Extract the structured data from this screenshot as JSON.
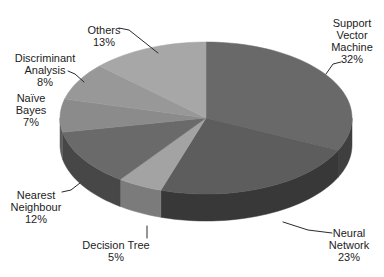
{
  "figure": {
    "background": "#ffffff"
  },
  "chart_data": {
    "type": "pie",
    "style": "3d",
    "unit": "%",
    "legend_position": "none",
    "geometry": {
      "cx": 206,
      "cy": 118,
      "rx": 146,
      "ry": 76,
      "depth": 27,
      "start_angle_deg": 0,
      "direction": "clockwise"
    },
    "label_font_px": 11,
    "label_line_height_px": 12,
    "label_color": "#1c1c1c",
    "leader_color": "#2a2a2a",
    "slices": [
      {
        "label": "Support Vector Machine",
        "value": 32,
        "color_top": "#696969",
        "color_side": "#3f3f3f",
        "label_lines": [
          "Support",
          "Vector",
          "Machine",
          "32%"
        ],
        "label_x": 352,
        "label_y": 27,
        "leader": [
          [
            341,
            62
          ],
          [
            333,
            64
          ],
          [
            326,
            74
          ]
        ]
      },
      {
        "label": "Neural Network",
        "value": 23,
        "color_top": "#5d5d5d",
        "color_side": "#383838",
        "label_lines": [
          "Neural",
          "Network",
          "23%"
        ],
        "label_x": 349,
        "label_y": 237,
        "leader": [
          [
            332,
            233
          ],
          [
            308,
            230
          ],
          [
            283,
            222
          ]
        ]
      },
      {
        "label": "Decision Tree",
        "value": 5,
        "color_top": "#a3a3a3",
        "color_side": "#7b7b7b",
        "label_lines": [
          "Decision Tree",
          "5%"
        ],
        "label_x": 116,
        "label_y": 249,
        "leader": [
          [
            147,
            238
          ],
          [
            147,
            226
          ]
        ]
      },
      {
        "label": "Nearest Neighbour",
        "value": 12,
        "color_top": "#6a6a6a",
        "color_side": "#474747",
        "label_lines": [
          "Nearest",
          "Neighbour",
          "12%"
        ],
        "label_x": 36,
        "label_y": 199,
        "leader": [
          [
            62,
            192
          ],
          [
            71,
            190
          ],
          [
            80,
            183
          ]
        ]
      },
      {
        "label": "Naïve Bayes",
        "value": 7,
        "color_top": "#8b8b8b",
        "color_side": "#5c5c5c",
        "label_lines": [
          "Naïve",
          "Bayes",
          "7%"
        ],
        "label_x": 31,
        "label_y": 102,
        "leader": []
      },
      {
        "label": "Discriminant Analysis",
        "value": 8,
        "color_top": "#989898",
        "color_side": "#6a6a6a",
        "label_lines": [
          "Discriminant",
          "Analysis",
          "8%"
        ],
        "label_x": 45,
        "label_y": 62,
        "leader": [
          [
            68,
            71
          ],
          [
            75,
            74
          ],
          [
            84,
            82
          ]
        ]
      },
      {
        "label": "Others",
        "value": 13,
        "color_top": "#a7a7a7",
        "color_side": "#7e7e7e",
        "label_lines": [
          "Others",
          "13%"
        ],
        "label_x": 104,
        "label_y": 34,
        "leader": [
          [
            119,
            28
          ],
          [
            129,
            30
          ],
          [
            158,
            53
          ]
        ]
      }
    ]
  }
}
